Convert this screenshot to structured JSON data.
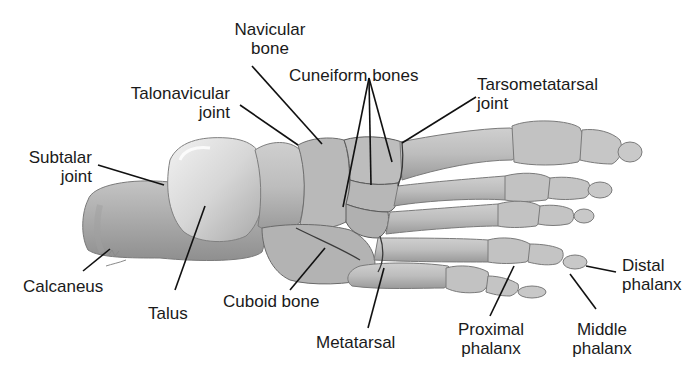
{
  "figure": {
    "colors": {
      "background": "#ffffff",
      "bone_light": "#d9d9d9",
      "bone_mid": "#b5b5b5",
      "bone_dark": "#8c8c8c",
      "leader_line": "#111111",
      "label_text": "#1a1a1a"
    }
  },
  "labels": {
    "navicular": {
      "line1": "Navicular",
      "line2": "bone"
    },
    "cuneiform": {
      "line1": "Cuneiform bones"
    },
    "talonavicular": {
      "line1": "Talonavicular",
      "line2": "joint"
    },
    "tarsometatarsal": {
      "line1": "Tarsometatarsal",
      "line2": "joint"
    },
    "subtalar": {
      "line1": "Subtalar",
      "line2": "joint"
    },
    "calcaneus": {
      "line1": "Calcaneus"
    },
    "talus": {
      "line1": "Talus"
    },
    "cuboid": {
      "line1": "Cuboid bone"
    },
    "metatarsal": {
      "line1": "Metatarsal"
    },
    "proximal_phalanx": {
      "line1": "Proximal",
      "line2": "phalanx"
    },
    "middle_phalanx": {
      "line1": "Middle",
      "line2": "phalanx"
    },
    "distal_phalanx": {
      "line1": "Distal",
      "line2": "phalanx"
    }
  }
}
